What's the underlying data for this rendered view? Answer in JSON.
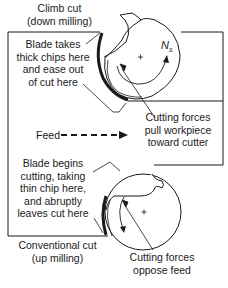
{
  "top": {
    "heading": [
      "Climb cut",
      "(down milling)"
    ],
    "blade_note": [
      "Blade takes",
      "thick chips here",
      "and ease out",
      "of cut here"
    ],
    "force_note": [
      "Cutting forces",
      "pull workpiece",
      "toward cutter"
    ],
    "rotation_label": "N",
    "rotation_sub": "s"
  },
  "feed": {
    "label": "Feed"
  },
  "bottom": {
    "blade_note": [
      "Blade begins",
      "cutting, taking",
      "thin chip here,",
      "and abruptly",
      "leaves cut here"
    ],
    "heading": [
      "Conventional cut",
      "(up milling)"
    ],
    "force_note": [
      "Cutting forces",
      "oppose feed"
    ]
  },
  "colors": {
    "line": "#1a1a1a",
    "background": "#ffffff"
  }
}
